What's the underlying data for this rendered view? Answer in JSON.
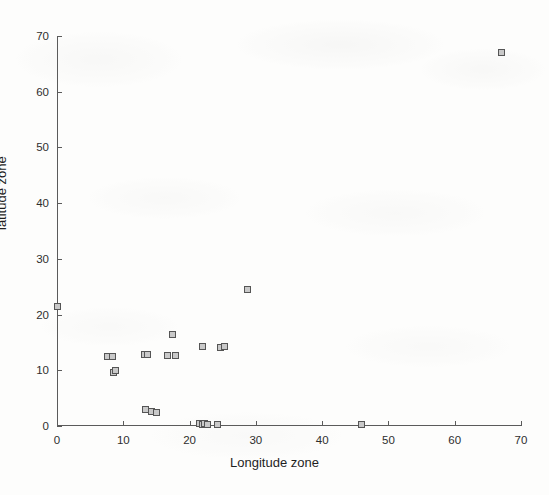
{
  "chart_data": {
    "type": "scatter",
    "title": "",
    "xlabel": "Longitude zone",
    "ylabel": "latitude zone",
    "xlim": [
      0,
      70
    ],
    "ylim": [
      0,
      70
    ],
    "xticks": [
      0,
      10,
      20,
      30,
      40,
      50,
      60,
      70
    ],
    "yticks": [
      0,
      10,
      20,
      30,
      40,
      50,
      60,
      70
    ],
    "xticklabels": [
      "0",
      "10",
      "20",
      "30",
      "40",
      "50",
      "60",
      "70"
    ],
    "yticklabels": [
      "0",
      "10",
      "20",
      "30",
      "40",
      "50",
      "60",
      "70"
    ],
    "grid": false,
    "legend": null,
    "marker_style": "square",
    "marker_face_color": "#c9c9c9",
    "marker_edge_color": "#555555",
    "axis_color": "#5b5b5b",
    "background_color": "#fdfdfc",
    "series": [
      {
        "name": "zones",
        "points": [
          [
            0.0,
            21.5
          ],
          [
            7.6,
            12.5
          ],
          [
            8.3,
            12.5
          ],
          [
            8.5,
            9.6
          ],
          [
            8.9,
            10.0
          ],
          [
            13.2,
            12.9
          ],
          [
            13.7,
            12.9
          ],
          [
            13.4,
            2.9
          ],
          [
            14.3,
            2.6
          ],
          [
            15.0,
            2.4
          ],
          [
            16.6,
            12.7
          ],
          [
            17.4,
            16.4
          ],
          [
            17.9,
            12.6
          ],
          [
            21.5,
            0.4
          ],
          [
            21.9,
            0.3
          ],
          [
            22.3,
            0.5
          ],
          [
            22.0,
            14.2
          ],
          [
            22.7,
            0.2
          ],
          [
            24.2,
            0.3
          ],
          [
            24.6,
            14.1
          ],
          [
            25.2,
            14.2
          ],
          [
            28.7,
            24.5
          ],
          [
            46.0,
            0.3
          ],
          [
            67.1,
            67.0
          ]
        ]
      }
    ]
  }
}
